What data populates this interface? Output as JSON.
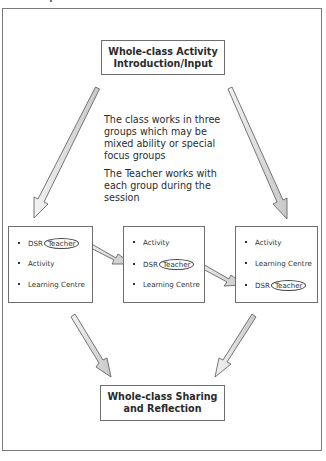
{
  "diagram": {
    "top_box": {
      "line1": "Whole-class Activity",
      "line2": "Introduction/Input"
    },
    "description": {
      "paragraph1": "The class works in three groups which may be mixed ability or special focus groups",
      "paragraph2": "The Teacher works with each group during the session"
    },
    "groups": [
      {
        "items": [
          {
            "prefix": "DSR",
            "highlight": "Teacher"
          },
          {
            "prefix": "Activity",
            "highlight": ""
          },
          {
            "prefix": "Learning Centre",
            "highlight": ""
          }
        ]
      },
      {
        "items": [
          {
            "prefix": "Activity",
            "highlight": ""
          },
          {
            "prefix": "DSR",
            "highlight": "Teacher"
          },
          {
            "prefix": "Learning Centre",
            "highlight": ""
          }
        ]
      },
      {
        "items": [
          {
            "prefix": "Activity",
            "highlight": ""
          },
          {
            "prefix": "Learning Centre",
            "highlight": ""
          },
          {
            "prefix": "DSR",
            "highlight": "Teacher"
          }
        ]
      }
    ],
    "bottom_box": {
      "line1": "Whole-class Sharing",
      "line2": "and Reflection"
    },
    "colors": {
      "arrow_fill": "#d9d9d9",
      "arrow_stroke": "#555555",
      "box_border": "#6e6e6e",
      "frame_border": "#7a7a7a"
    }
  }
}
